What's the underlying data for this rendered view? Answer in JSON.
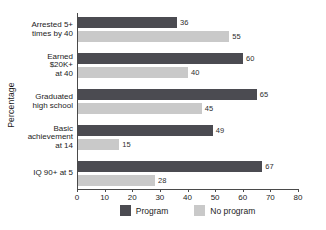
{
  "chart_data": {
    "type": "bar",
    "orientation": "horizontal",
    "title": "",
    "xlabel": "",
    "ylabel": "Percentage",
    "xlim": [
      0,
      80
    ],
    "xticks": [
      0,
      10,
      20,
      30,
      40,
      50,
      60,
      70,
      80
    ],
    "grid": false,
    "legend_position": "bottom",
    "categories": [
      "Arrested 5+\ntimes by 40",
      "Earned\n$20K+\nat 40",
      "Graduated\nhigh school",
      "Basic\nachievement\nat 14",
      "IQ 90+ at 5"
    ],
    "series": [
      {
        "name": "Program",
        "color": "#4b4b51",
        "values": [
          36,
          60,
          65,
          49,
          67
        ]
      },
      {
        "name": "No program",
        "color": "#c9c9c9",
        "values": [
          55,
          40,
          45,
          15,
          28
        ]
      }
    ],
    "value_labels_shown": true
  },
  "colors": {
    "axis": "#4a4a4a",
    "text": "#1c1c1c",
    "value_text": "#2e2e2e",
    "background": "#ffffff"
  }
}
